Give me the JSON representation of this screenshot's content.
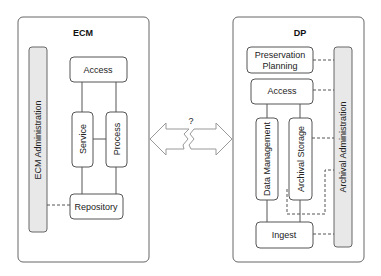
{
  "ecm": {
    "title": "ECM",
    "admin": "ECM Administration",
    "access": "Access",
    "service": "Service",
    "process": "Process",
    "repository": "Repository"
  },
  "dp": {
    "title": "DP",
    "preservation_line1": "Preservation",
    "preservation_line2": "Planning",
    "access": "Access",
    "data_management": "Data Management",
    "archival_storage": "Archival Storage",
    "ingest": "Ingest",
    "admin": "Archival Administration"
  },
  "connector": {
    "label": "?"
  }
}
